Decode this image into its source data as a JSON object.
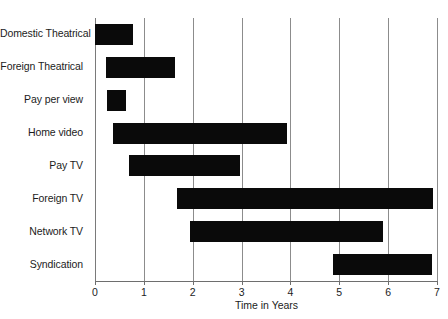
{
  "chart_data": {
    "type": "bar",
    "orientation": "horizontal",
    "subtype": "range-bar",
    "title": "",
    "xlabel": "Time in Years",
    "ylabel": "",
    "xlim": [
      0,
      7
    ],
    "ylim": null,
    "grid": true,
    "legend": null,
    "xticks": [
      "0",
      "1",
      "2",
      "3",
      "4",
      "5",
      "6",
      "7"
    ],
    "xtick_values": [
      0,
      1,
      2,
      3,
      4,
      5,
      6,
      7
    ],
    "categories": [
      "Domestic Theatrical",
      "Foreign Theatrical",
      "Pay per view",
      "Home video",
      "Pay TV",
      "Foreign TV",
      "Network TV",
      "Syndication"
    ],
    "bars": [
      {
        "label": "Domestic Theatrical",
        "start": 0.0,
        "end": 0.78
      },
      {
        "label": "Foreign Theatrical",
        "start": 0.22,
        "end": 1.63
      },
      {
        "label": "Pay per view",
        "start": 0.25,
        "end": 0.63
      },
      {
        "label": "Home video",
        "start": 0.37,
        "end": 3.93
      },
      {
        "label": "Pay TV",
        "start": 0.7,
        "end": 2.97
      },
      {
        "label": "Foreign TV",
        "start": 1.68,
        "end": 6.92
      },
      {
        "label": "Network TV",
        "start": 1.95,
        "end": 5.9
      },
      {
        "label": "Syndication",
        "start": 4.87,
        "end": 6.9
      }
    ],
    "colors": {
      "bar": "#0a0a0a",
      "grid": "#8c8c8c",
      "axis": "#6e6e6e",
      "text": "#1c1c1c",
      "background": "#ffffff"
    }
  }
}
